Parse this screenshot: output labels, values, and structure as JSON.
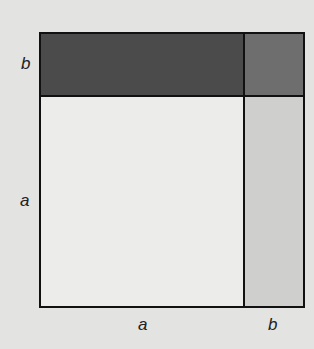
{
  "diagram": {
    "title": "",
    "labels": {
      "left_top": "b",
      "left_bottom": "a",
      "bottom_left": "a",
      "bottom_right": "b"
    },
    "regions": [
      {
        "name": "a-by-b-top",
        "color": "#4b4b4b"
      },
      {
        "name": "b-by-b",
        "color": "#6e6e6e"
      },
      {
        "name": "a-by-a",
        "color": "#ececea"
      },
      {
        "name": "a-by-b-right",
        "color": "#cfcfcd"
      }
    ]
  }
}
